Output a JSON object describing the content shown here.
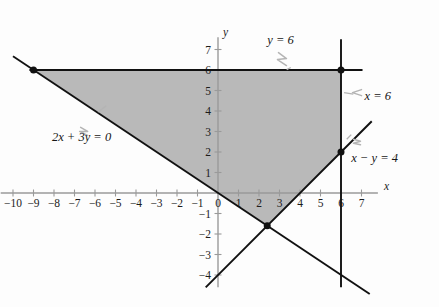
{
  "figure": {
    "kind": "linear-programming-feasible-region",
    "axis_labels": {
      "x": "x",
      "y": "y"
    },
    "origin_label": "0"
  },
  "chart_data": {
    "type": "line",
    "title": "",
    "xlabel": "x",
    "ylabel": "y",
    "xlim": [
      -10.6,
      7.8
    ],
    "ylim": [
      -4.6,
      7.6
    ],
    "grid": false,
    "legend": "none",
    "x_ticks": [
      -10,
      -9,
      -8,
      -7,
      -6,
      -5,
      -4,
      -3,
      -2,
      -1,
      0,
      1,
      2,
      3,
      4,
      5,
      6,
      7
    ],
    "x_tick_labels": [
      "-10",
      "-9",
      "-8",
      "-7",
      "-6",
      "-5",
      "-4",
      "-3",
      "-2",
      "-1",
      "0",
      "1",
      "2",
      "3",
      "4",
      "5",
      "6",
      "7"
    ],
    "y_ticks": [
      -4,
      -3,
      -2,
      -1,
      1,
      2,
      3,
      4,
      5,
      6,
      7
    ],
    "y_tick_labels": [
      "-4",
      "-3",
      "-2",
      "-1",
      "1",
      "2",
      "3",
      "4",
      "5",
      "6",
      "7"
    ],
    "series": [
      {
        "name": "y = 6",
        "label": "y = 6",
        "equation": "y = 6",
        "kind": "horizontal-line",
        "points": [
          [
            -9.2,
            6
          ],
          [
            7.05,
            6
          ]
        ]
      },
      {
        "name": "x = 6",
        "label": "x = 6",
        "equation": "x = 6",
        "kind": "vertical-line",
        "points": [
          [
            6,
            7.5
          ],
          [
            6,
            -4.6
          ]
        ]
      },
      {
        "name": "2x + 3y = 0",
        "label": "2x + 3y = 0",
        "equation": "2x + 3y = 0",
        "kind": "line",
        "slope": -0.6667,
        "intercept": 0,
        "points": [
          [
            -10.0,
            6.667
          ],
          [
            7.4,
            -4.93
          ]
        ]
      },
      {
        "name": "x - y = 4",
        "label": "x − y = 4",
        "equation": "x − y = 4",
        "kind": "line",
        "slope": 1,
        "intercept": -4,
        "points": [
          [
            -0.6,
            -4.6
          ],
          [
            7.5,
            3.5
          ]
        ]
      }
    ],
    "shaded_region": {
      "name": "feasible-region",
      "fill": "#b9b9b9",
      "vertices": [
        [
          -9,
          6
        ],
        [
          6,
          6
        ],
        [
          6,
          2
        ],
        [
          2.4,
          -1.6
        ]
      ]
    },
    "marked_points": [
      {
        "label": "",
        "x": -9,
        "y": 6
      },
      {
        "label": "",
        "x": 6,
        "y": 6
      },
      {
        "label": "",
        "x": 6,
        "y": 2
      },
      {
        "label": "",
        "x": 2.4,
        "y": -1.6
      }
    ],
    "annotations": [
      {
        "text": "y = 6",
        "x": 3.05,
        "y": 7.25
      },
      {
        "text": "x = 6",
        "x": 7.15,
        "y": 4.55
      },
      {
        "text": "2x + 3y = 0",
        "x": -8.1,
        "y": 2.55
      },
      {
        "text": "x − y = 4",
        "x": 6.5,
        "y": 1.5
      }
    ]
  },
  "colors": {
    "shading": "#b9b9b9",
    "line": "#111111",
    "axis": "#9a9a9a",
    "text": "#1c1c1c",
    "leader": "#b4b4b4",
    "background": "#fdfdfd"
  }
}
